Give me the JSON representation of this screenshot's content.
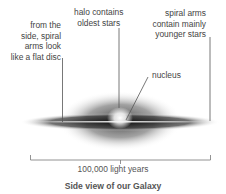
{
  "labels": {
    "side_disc": [
      "from the",
      "side, spiral",
      "arms look",
      "like a flat disc"
    ],
    "halo": [
      "halo contains",
      "oldest stars"
    ],
    "spiral_arms": [
      "spiral arms",
      "contain mainly",
      "younger stars"
    ],
    "nucleus": "nucleus"
  },
  "scale": {
    "text": "100,000 light years"
  },
  "caption": "Side view of our Galaxy"
}
